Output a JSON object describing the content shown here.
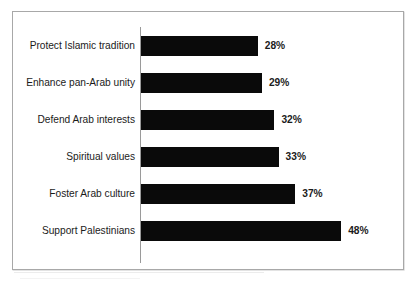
{
  "chart_data": {
    "type": "bar",
    "orientation": "horizontal",
    "title": "",
    "subtitle": "",
    "xlabel": "",
    "ylabel": "",
    "categories": [
      "Protect Islamic tradition",
      "Enhance pan-Arab unity",
      "Defend Arab interests",
      "Spiritual values",
      "Foster Arab culture",
      "Support Palestinians"
    ],
    "values": [
      28,
      29,
      32,
      33,
      37,
      48
    ],
    "value_labels": [
      "28%",
      "29%",
      "32%",
      "33%",
      "37%",
      "48%"
    ],
    "value_unit": "%",
    "xlim": [
      0,
      48
    ],
    "grid": false,
    "legend": null,
    "legend_position": "none",
    "bar_color": "#0a0a0a",
    "axis_color": "#9a9a9a",
    "frame_color": "#a8a8a8",
    "background_color": "#ffffff",
    "text_color": "#1b1b1b",
    "pixels_per_unit": 4.17
  }
}
